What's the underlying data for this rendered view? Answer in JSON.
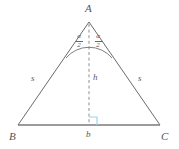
{
  "figure": {
    "type": "geometry-diagram",
    "background_color": "#ffffff",
    "stroke_color": "#6b6b6b",
    "base_stroke_color": "#7a7a7a",
    "dashed_stroke_color": "#8a8a8a",
    "right_angle_color": "#9fd4e8",
    "text_color": "#555555",
    "vertices": {
      "apex": {
        "label": "A",
        "x": 89,
        "y": 22
      },
      "bottom_left": {
        "label": "B",
        "x": 18,
        "y": 125
      },
      "bottom_right": {
        "label": "C",
        "x": 160,
        "y": 125
      },
      "foot": {
        "label": "b",
        "x": 89,
        "y": 125
      }
    },
    "segments": {
      "left_side_label": "s",
      "right_side_label": "s",
      "altitude_label": "h"
    },
    "apex_angle": {
      "left": {
        "numerator": "α",
        "denominator": "2"
      },
      "right": {
        "numerator": "α",
        "denominator": "2"
      },
      "arc": true
    },
    "right_angle_marker": {
      "present": true,
      "at": "foot",
      "size": 8
    }
  }
}
